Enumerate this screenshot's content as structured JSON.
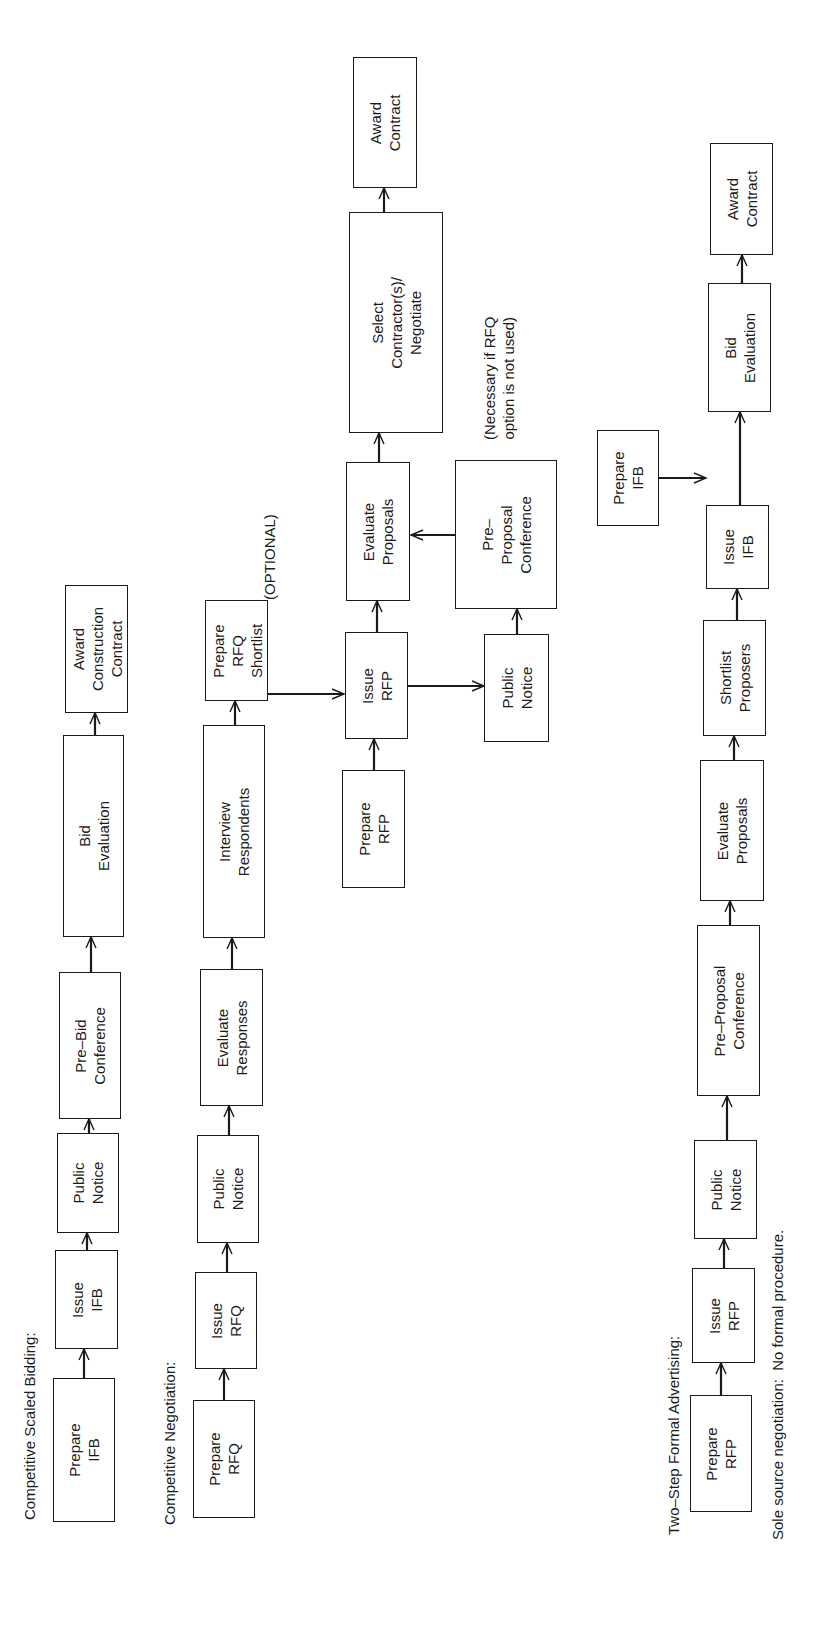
{
  "orientation": "rotated -90deg (landscape page printed sideways)",
  "sections": [
    {
      "id": "competitive-scaled-bidding",
      "label": "Competitive Scaled Bidding:",
      "steps": [
        {
          "id": "csb-prepare-ifb",
          "text": "Prepare\nIFB"
        },
        {
          "id": "csb-issue-ifb",
          "text": "Issue\nIFB"
        },
        {
          "id": "csb-public-notice",
          "text": "Public\nNotice"
        },
        {
          "id": "csb-pre-bid-conference",
          "text": "Pre–Bid\nConference"
        },
        {
          "id": "csb-bid-evaluation",
          "text": "Bid\nEvaluation"
        },
        {
          "id": "csb-award-construction-contract",
          "text": "Award\nConstruction\nContract"
        }
      ]
    },
    {
      "id": "competitive-negotiation",
      "label": "Competitive Negotiation:",
      "steps": [
        {
          "id": "cn-prepare-rfq",
          "text": "Prepare\nRFQ"
        },
        {
          "id": "cn-issue-rfq",
          "text": "Issue\nRFQ"
        },
        {
          "id": "cn-public-notice",
          "text": "Public\nNotice"
        },
        {
          "id": "cn-evaluate-responses",
          "text": "Evaluate\nResponses"
        },
        {
          "id": "cn-interview-respondents",
          "text": "Interview\nRespondents"
        },
        {
          "id": "cn-prepare-rfq-shortlist",
          "text": "Prepare\nRFQ\nShortlist"
        }
      ],
      "optional_note": "(OPTIONAL)",
      "rfp_branch": {
        "steps": [
          {
            "id": "cn-prepare-rfp",
            "text": "Prepare\nRFP"
          },
          {
            "id": "cn-issue-rfp",
            "text": "Issue\nRFP"
          },
          {
            "id": "cn-evaluate-proposals",
            "text": "Evaluate\nProposals"
          },
          {
            "id": "cn-select-contractors",
            "text": "Select\nContractor(s)/\nNegotiate"
          },
          {
            "id": "cn-award-contract",
            "text": "Award\nContract"
          },
          {
            "id": "cn-public-notice-2",
            "text": "Public\nNotice"
          },
          {
            "id": "cn-pre-proposal-conference",
            "text": "Pre–\nProposal\nConference"
          }
        ],
        "necessary_note": "(Necessary if RFQ\noption is not used)"
      }
    },
    {
      "id": "two-step-formal-advertising",
      "label": "Two–Step Formal Advertising:",
      "steps": [
        {
          "id": "ts-prepare-rfp",
          "text": "Prepare\nRFP"
        },
        {
          "id": "ts-issue-rfp",
          "text": "Issue\nRFP"
        },
        {
          "id": "ts-public-notice",
          "text": "Public\nNotice"
        },
        {
          "id": "ts-pre-proposal-conference",
          "text": "Pre–Proposal\nConference"
        },
        {
          "id": "ts-evaluate-proposals",
          "text": "Evaluate\nProposals"
        },
        {
          "id": "ts-shortlist-proposers",
          "text": "Shortlist\nProposers"
        },
        {
          "id": "ts-issue-ifb",
          "text": "Issue\nIFB"
        },
        {
          "id": "ts-bid-evaluation",
          "text": "Bid\nEvaluation"
        },
        {
          "id": "ts-award-contract",
          "text": "Award\nContract"
        },
        {
          "id": "ts-prepare-ifb",
          "text": "Prepare\nIFB"
        }
      ]
    },
    {
      "id": "sole-source-negotiation",
      "label": "Sole source negotiation:  No formal procedure."
    }
  ],
  "colors": {
    "ink": "#1a1a1a",
    "paper": "#ffffff"
  }
}
